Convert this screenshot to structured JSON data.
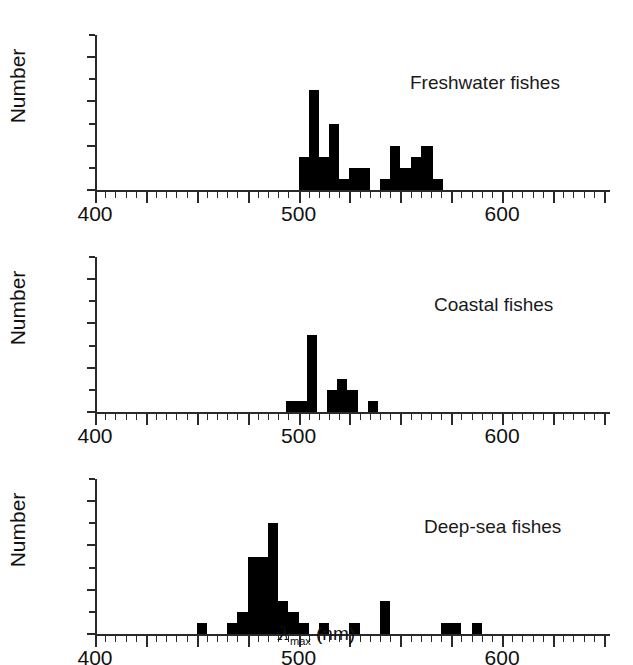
{
  "figure": {
    "xlabel_lambda": "λ",
    "xlabel_sub": "max",
    "xlabel_units": " (nm)",
    "ylabel": "Number"
  },
  "chart_data": [
    {
      "type": "bar",
      "title": "Freshwater fishes",
      "xlabel": "λmax (nm)",
      "ylabel": "Number",
      "xlim": [
        400,
        653
      ],
      "ylim": [
        0,
        14
      ],
      "yticks": [
        0,
        4,
        8,
        12
      ],
      "ytick_labels": [
        "0",
        "4",
        "8",
        "12"
      ],
      "yminor_step": 2,
      "xticks": [
        400,
        500,
        600
      ],
      "xtick_labels": [
        "400",
        "500",
        "600"
      ],
      "xminor_step": 5,
      "xmajor_step": 25,
      "bin_width": 5,
      "grid": false,
      "legend": "none",
      "bins": [
        500,
        505,
        510,
        515,
        520,
        525,
        530,
        535,
        540,
        545,
        550,
        555,
        560
      ],
      "values": [
        3,
        9,
        3,
        6,
        1,
        2,
        2,
        0,
        1,
        4,
        2,
        3,
        4
      ],
      "extra_bars": [
        {
          "x": 561,
          "value": 4
        },
        {
          "x": 566,
          "value": 1
        }
      ]
    },
    {
      "type": "bar",
      "title": "Coastal fishes",
      "xlabel": "λmax (nm)",
      "ylabel": "Number",
      "xlim": [
        400,
        653
      ],
      "ylim": [
        0,
        14
      ],
      "yticks": [
        0,
        4,
        8,
        12
      ],
      "ytick_labels": [
        "0",
        "4",
        "8",
        "12"
      ],
      "yminor_step": 2,
      "xticks": [
        400,
        500,
        600
      ],
      "xtick_labels": [
        "400",
        "500",
        "600"
      ],
      "xminor_step": 5,
      "xmajor_step": 25,
      "bin_width": 5,
      "grid": false,
      "legend": "none",
      "bins": [
        494,
        499,
        504,
        509,
        514,
        519,
        524,
        529,
        534
      ],
      "values": [
        1,
        1,
        7,
        0,
        2,
        3,
        2,
        0,
        1
      ]
    },
    {
      "type": "bar",
      "title": "Deep-sea fishes",
      "xlabel": "λmax (nm)",
      "ylabel": "Number",
      "xlim": [
        400,
        653
      ],
      "ylim": [
        0,
        14
      ],
      "yticks": [
        0,
        4,
        8,
        12
      ],
      "ytick_labels": [
        "0",
        "4",
        "8",
        "12"
      ],
      "yminor_step": 2,
      "xticks": [
        400,
        500,
        600
      ],
      "xtick_labels": [
        "400",
        "500",
        "600"
      ],
      "xminor_step": 5,
      "xmajor_step": 25,
      "bin_width": 5,
      "grid": false,
      "legend": "none",
      "bins": [
        450,
        465,
        470,
        475,
        480,
        485,
        490,
        495,
        500,
        505,
        510,
        515,
        520,
        525,
        530,
        540,
        545,
        550,
        555,
        560,
        570,
        575,
        580,
        585
      ],
      "values": [
        1,
        1,
        2,
        7,
        7,
        10,
        3,
        2,
        1,
        0,
        1,
        0,
        0,
        1,
        0,
        3,
        0,
        0,
        0,
        0,
        1,
        1,
        0,
        1
      ]
    }
  ],
  "axis": {
    "x_start_px": 95,
    "x_per_nm": 2.04,
    "y_zero_px": 190,
    "y_per_unit": 9.8
  }
}
